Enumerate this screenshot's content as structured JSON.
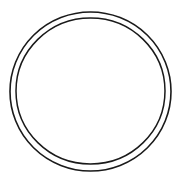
{
  "canvas": {
    "width": 182,
    "height": 191,
    "background_color": "#ffffff",
    "figure_name": "concentric-circles"
  },
  "figure": {
    "type": "line-drawing",
    "shape_count": 2,
    "stroke_color": "#1a1a1a",
    "fill_color": "none"
  },
  "chart_data": {
    "type": "scatter",
    "title": "",
    "subtitle": "",
    "xlabel": "",
    "ylabel": "",
    "grid": false,
    "legend": "none",
    "xlim": [
      0,
      182
    ],
    "ylim": [
      0,
      191
    ],
    "annotations": [],
    "series": [
      {
        "name": "outer-circle",
        "shape": "circle",
        "center_x": 90.5,
        "center_y": 91.5,
        "radius_x": 80.5,
        "radius_y": 79.5,
        "diameter": 161,
        "stroke_color": "#1a1a1a",
        "stroke_width": 1.6,
        "fill": "none"
      },
      {
        "name": "inner-circle",
        "shape": "circle",
        "center_x": 90.5,
        "center_y": 91.0,
        "radius_x": 74.5,
        "radius_y": 73.0,
        "diameter": 149,
        "stroke_color": "#1a1a1a",
        "stroke_width": 1.5,
        "fill": "none"
      }
    ],
    "ring_gap": 6
  },
  "outer_circle": {
    "label": "outer circle",
    "cx": "90.5",
    "cy": "91.5",
    "rx": "80.5",
    "ry": "79.5",
    "stroke": "#1a1a1a",
    "stroke_width": "1.6"
  },
  "inner_circle": {
    "label": "inner circle",
    "cx": "90.5",
    "cy": "91",
    "rx": "74.5",
    "ry": "73",
    "stroke": "#1a1a1a",
    "stroke_width": "1.5"
  }
}
